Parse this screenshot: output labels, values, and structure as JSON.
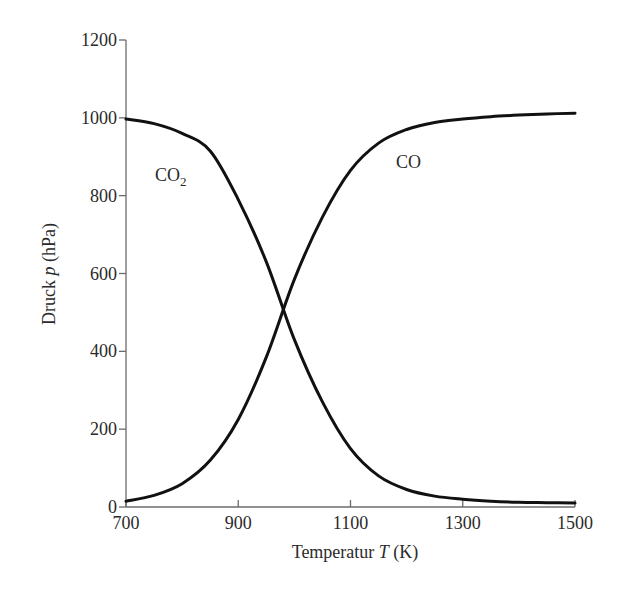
{
  "chart_data": {
    "type": "line",
    "title": "",
    "xlabel": "Temperatur T (K)",
    "xlabel_parts": {
      "pre": "Temperatur ",
      "var": "T",
      "post": " (K)"
    },
    "ylabel": "Druck p (hPa)",
    "ylabel_parts": {
      "pre": "Druck ",
      "var": "p",
      "post": " (hPa)"
    },
    "xlim": [
      700,
      1500
    ],
    "ylim": [
      0,
      1200
    ],
    "xticks": [
      700,
      900,
      1100,
      1300,
      1500
    ],
    "yticks": [
      0,
      200,
      400,
      600,
      800,
      1000,
      1200
    ],
    "grid": false,
    "legend": "inline labels",
    "x": [
      700,
      750,
      800,
      850,
      900,
      950,
      1000,
      1050,
      1100,
      1150,
      1200,
      1250,
      1300,
      1350,
      1400,
      1450,
      1500
    ],
    "series": [
      {
        "name": "CO2",
        "label_main": "CO",
        "label_sub": "2",
        "values": [
          997,
          985,
          960,
          915,
          790,
          630,
          430,
          270,
          150,
          80,
          45,
          28,
          20,
          15,
          12,
          11,
          10
        ]
      },
      {
        "name": "CO",
        "label_main": "CO",
        "label_sub": "",
        "values": [
          15,
          30,
          60,
          120,
          225,
          385,
          585,
          745,
          865,
          935,
          970,
          988,
          997,
          1003,
          1007,
          1010,
          1012
        ]
      }
    ],
    "annotations": [
      {
        "text": "CO2",
        "near": {
          "x": 790,
          "y": 850
        }
      },
      {
        "text": "CO",
        "near": {
          "x": 1200,
          "y": 880
        }
      }
    ]
  }
}
